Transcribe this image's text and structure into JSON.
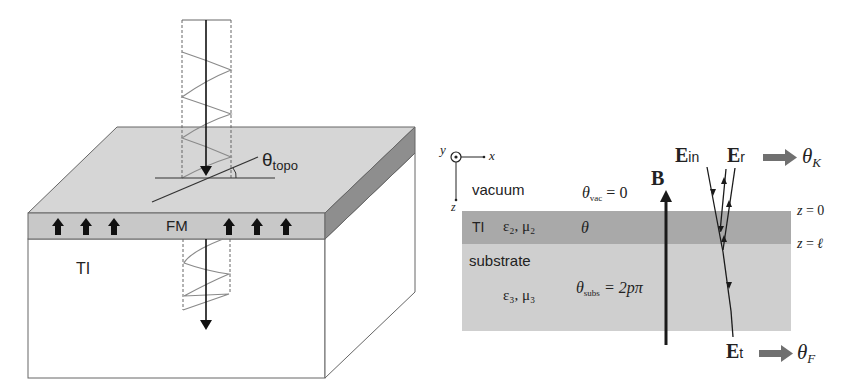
{
  "left_diagram": {
    "labels": {
      "theta_topo": "θ",
      "theta_topo_sub": "topo",
      "fm_layer": "FM",
      "ti_bulk": "TI"
    },
    "colors": {
      "top_surface": "#d4d4d4",
      "fm_layer": "#c9c9c9",
      "side_face": "#8e8e8e",
      "bulk": "#ffffff",
      "outline": "#555555",
      "wave": "#8a8a8a",
      "arrow": "#111111"
    },
    "magnetization_arrow_count": 6
  },
  "right_diagram": {
    "axes": {
      "y_label": "y",
      "x_label": "x",
      "z_label": "z"
    },
    "regions": {
      "vacuum_label": "vacuum",
      "ti_label": "TI",
      "ti_eps_mu": "ε₂, μ₂",
      "substrate_label": "substrate",
      "substrate_eps_mu": "ε₃, μ₃"
    },
    "theta": {
      "vac_symbol": "θ",
      "vac_sub": "vac",
      "vac_value": " = 0",
      "ti": "θ",
      "subs_symbol": "θ",
      "subs_sub": "subs",
      "subs_value": " = 2pπ"
    },
    "field_label": "B",
    "interfaces": {
      "z0": "z = 0",
      "zl": "z = ℓ"
    },
    "beams": {
      "incident": "E",
      "incident_sub": "in",
      "reflected": "E",
      "reflected_sub": "r",
      "transmitted": "E",
      "transmitted_sub": "t",
      "kerr": "θ",
      "kerr_sub": "K",
      "faraday": "θ",
      "faraday_sub": "F"
    },
    "colors": {
      "ti_band": "#a9a9a9",
      "substrate": "#cfcfcf",
      "arrow_big": "#707070",
      "line": "#1a1a1a"
    }
  }
}
